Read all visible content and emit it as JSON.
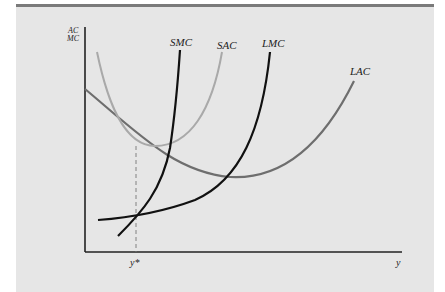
{
  "figure": {
    "y_axis_label_line1": "AC",
    "y_axis_label_line2": "MC",
    "x_axis_label": "y",
    "marker_label": "y*",
    "curves": [
      {
        "name": "SMC",
        "label": "SMC",
        "color": "#111111"
      },
      {
        "name": "SAC",
        "label": "SAC",
        "color": "#a9a9a9"
      },
      {
        "name": "LMC",
        "label": "LMC",
        "color": "#111111"
      },
      {
        "name": "LAC",
        "label": "LAC",
        "color": "#6e6e6e"
      }
    ]
  },
  "colors": {
    "background": "#e6e6e6",
    "top_bar": "#7a7a7a",
    "axis": "#222222"
  }
}
